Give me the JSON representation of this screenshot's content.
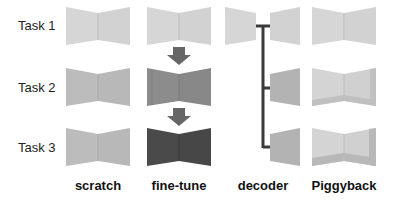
{
  "rows": [
    {
      "label": "Task 1"
    },
    {
      "label": "Task 2"
    },
    {
      "label": "Task 3"
    }
  ],
  "columns": [
    {
      "label": "scratch"
    },
    {
      "label": "fine-tune"
    },
    {
      "label": "decoder"
    },
    {
      "label": "Piggyback"
    }
  ],
  "colors": {
    "task1_fill": "#d6d6d6",
    "scratch_fill": "#b9b9b9",
    "finetune_task2_fill": "#8a8a8a",
    "finetune_task3_fill": "#4a4a4a",
    "decoder_head_fill": "#b3b3b3",
    "piggyback_mask_fill": "#c4c4c4",
    "arrow": "#666666",
    "connector": "#3a3a3a"
  }
}
